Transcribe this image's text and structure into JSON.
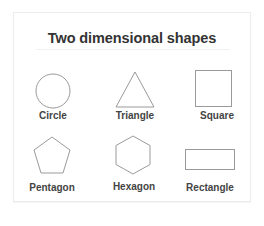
{
  "title": "Two dimensional shapes",
  "colors": {
    "shape_stroke": "#9a9a9a",
    "text": "#444444",
    "title": "#333333",
    "card_border": "#ececec"
  },
  "shapes": [
    {
      "name": "circle",
      "label": "Circle"
    },
    {
      "name": "triangle",
      "label": "Triangle"
    },
    {
      "name": "square",
      "label": "Square"
    },
    {
      "name": "pentagon",
      "label": "Pentagon"
    },
    {
      "name": "hexagon",
      "label": "Hexagon"
    },
    {
      "name": "rectangle",
      "label": "Rectangle"
    }
  ]
}
